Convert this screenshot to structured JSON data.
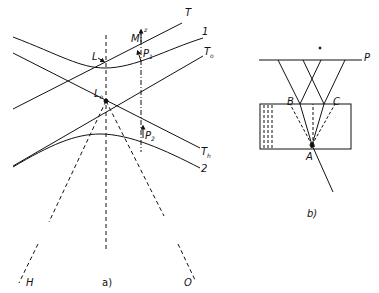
{
  "figure": {
    "panel_a": {
      "caption": "a)",
      "labels": {
        "T": "T",
        "one": "1",
        "T0": "T",
        "T0_sub": "o",
        "Th": "T",
        "Th_sub": "h",
        "two": "2",
        "L": "L",
        "L0": "L",
        "L0_sub": "o",
        "M": "M",
        "z": "z",
        "P1": "P",
        "P1_sub": "1",
        "P2": "P",
        "P2_sub": "2",
        "H": "H",
        "O": "O"
      }
    },
    "panel_b": {
      "caption": "b)",
      "labels": {
        "P": "P",
        "A": "A",
        "B": "B",
        "C": "C"
      }
    },
    "colors": {
      "ink": "#111111",
      "background": "#ffffff"
    }
  }
}
